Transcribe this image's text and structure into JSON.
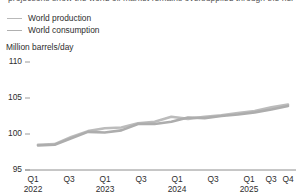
{
  "header": {
    "clipped_title": "projections show the world oil market remains oversupplied through the next two years"
  },
  "legend": {
    "position": "top-left",
    "items": [
      {
        "label": "World production",
        "color": "#b9b9b9",
        "key": "production"
      },
      {
        "label": "World consumption",
        "color": "#b0b0b0",
        "key": "consumption"
      }
    ]
  },
  "axes": {
    "y_unit_label": "Million barrels/day",
    "y_ticks": [
      "110",
      "105",
      "100",
      "95"
    ],
    "y_min": 95,
    "y_max": 110,
    "x_ticks": [
      {
        "quarter": "Q1",
        "year": "2022"
      },
      {
        "quarter": "Q3",
        "year": ""
      },
      {
        "quarter": "Q1",
        "year": "2023"
      },
      {
        "quarter": "Q3",
        "year": ""
      },
      {
        "quarter": "Q1",
        "year": "2024"
      },
      {
        "quarter": "Q3",
        "year": ""
      },
      {
        "quarter": "Q1",
        "year": "2025"
      },
      {
        "quarter": "Q3",
        "year": ""
      },
      {
        "quarter": "Q4",
        "year": ""
      }
    ]
  },
  "chart_data": {
    "type": "line",
    "title": "",
    "xlabel": "",
    "ylabel": "Million barrels/day",
    "ylim": [
      95,
      110
    ],
    "grid": false,
    "legend_position": "top-left",
    "categories": [
      "Q1 2022",
      "Q2 2022",
      "Q3 2022",
      "Q4 2022",
      "Q1 2023",
      "Q2 2023",
      "Q3 2023",
      "Q4 2023",
      "Q1 2024",
      "Q2 2024",
      "Q3 2024",
      "Q4 2024",
      "Q1 2025",
      "Q2 2025",
      "Q3 2025",
      "Q4 2025"
    ],
    "series": [
      {
        "name": "World production",
        "color": "#bcbcbc",
        "values": [
          98.5,
          98.6,
          99.6,
          100.4,
          100.8,
          100.9,
          101.5,
          101.7,
          102.4,
          102.1,
          102.4,
          102.6,
          102.9,
          103.2,
          103.7,
          104.1
        ]
      },
      {
        "name": "World consumption",
        "color": "#adadad",
        "values": [
          98.4,
          98.5,
          99.4,
          100.3,
          100.2,
          100.5,
          101.4,
          101.4,
          101.7,
          102.3,
          102.2,
          102.5,
          102.7,
          103.0,
          103.4,
          103.9
        ]
      }
    ]
  }
}
